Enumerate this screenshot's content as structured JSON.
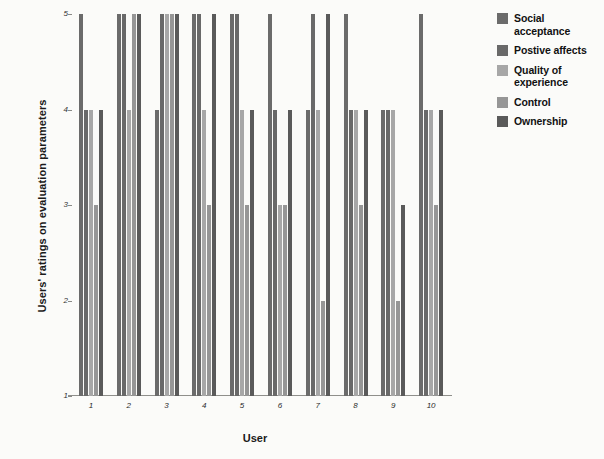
{
  "chart_data": {
    "type": "bar",
    "title": "",
    "xlabel": "User",
    "ylabel": "Users' ratings on evaluation parameters",
    "categories": [
      "1",
      "2",
      "3",
      "4",
      "5",
      "6",
      "7",
      "8",
      "9",
      "10"
    ],
    "ylim": [
      1,
      5
    ],
    "yticks": [
      "1",
      "2",
      "3",
      "4",
      "5"
    ],
    "grid": false,
    "legend_position": "right",
    "series": [
      {
        "name": "Social acceptance",
        "color": "#6b6b6b",
        "values": [
          5,
          5,
          4,
          5,
          5,
          5,
          4,
          5,
          4,
          5
        ]
      },
      {
        "name": "Postive affects",
        "color": "#696969",
        "values": [
          4,
          5,
          5,
          5,
          5,
          4,
          5,
          4,
          4,
          4
        ]
      },
      {
        "name": "Quality of experience",
        "color": "#a7a7a7",
        "values": [
          4,
          4,
          5,
          4,
          4,
          3,
          4,
          4,
          4,
          4
        ]
      },
      {
        "name": "Control",
        "color": "#969696",
        "values": [
          3,
          5,
          5,
          3,
          3,
          3,
          2,
          3,
          2,
          3
        ]
      },
      {
        "name": "Ownership",
        "color": "#5a5a5a",
        "values": [
          4,
          5,
          5,
          5,
          4,
          4,
          5,
          4,
          3,
          4
        ]
      }
    ]
  },
  "legend": {
    "items": [
      {
        "label": "Social acceptance"
      },
      {
        "label": "Postive affects"
      },
      {
        "label": "Quality of experience"
      },
      {
        "label": "Control"
      },
      {
        "label": "Ownership"
      }
    ]
  }
}
